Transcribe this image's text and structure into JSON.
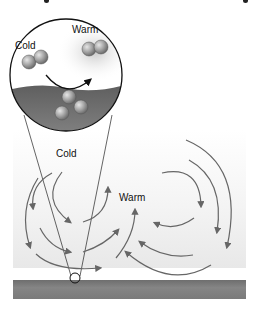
{
  "diagram": {
    "type": "convection-illustration",
    "magnified_view": {
      "labels": {
        "cold": "Cold",
        "warm": "Warm"
      },
      "molecule_groups": [
        {
          "name": "cold-air-pair",
          "count": 2
        },
        {
          "name": "warm-air-pair",
          "count": 2
        },
        {
          "name": "surface-molecules",
          "count": 3
        }
      ],
      "arrow": "curved arrow from cold molecules down to surface and up to warm molecules"
    },
    "main_view": {
      "labels": {
        "cold": "Cold",
        "warm": "Warm"
      },
      "elements": [
        "convection-cell-left",
        "convection-cell-right",
        "ground-surface",
        "magnify-point"
      ]
    },
    "colors": {
      "arrow": "#6a6a6a",
      "ground": "#777777",
      "water": "#6b6b6b",
      "molecule": "#9a9a9a",
      "outline": "#111111"
    }
  }
}
